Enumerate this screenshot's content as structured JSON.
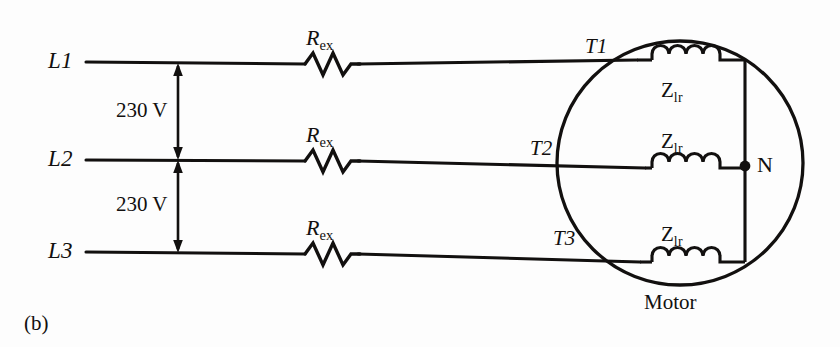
{
  "figure": {
    "caption": "(b)",
    "background_color": "#fdfdfd",
    "ink_color": "#12100f"
  },
  "supply": {
    "lines": [
      {
        "id": "L1",
        "label": "L1",
        "y": 62
      },
      {
        "id": "L2",
        "label": "L2",
        "y": 160
      },
      {
        "id": "L3",
        "label": "L3",
        "y": 252
      }
    ],
    "voltages": [
      {
        "label": "230 V",
        "between": "L1-L2"
      },
      {
        "label": "230 V",
        "between": "L2-L3"
      }
    ]
  },
  "resistors": [
    {
      "label": "R",
      "sub": "ex",
      "on_line": "L1"
    },
    {
      "label": "R",
      "sub": "ex",
      "on_line": "L2"
    },
    {
      "label": "R",
      "sub": "ex",
      "on_line": "L3"
    }
  ],
  "terminals": [
    {
      "label": "T1",
      "on_line": "L1"
    },
    {
      "label": "T2",
      "on_line": "L2"
    },
    {
      "label": "T3",
      "on_line": "L3"
    }
  ],
  "motor": {
    "label": "Motor",
    "neutral_label": "N",
    "windings": [
      {
        "label": "Z",
        "sub": "lr",
        "phase": "T1"
      },
      {
        "label": "Z",
        "sub": "lr",
        "phase": "T2"
      },
      {
        "label": "Z",
        "sub": "lr",
        "phase": "T3"
      }
    ]
  }
}
